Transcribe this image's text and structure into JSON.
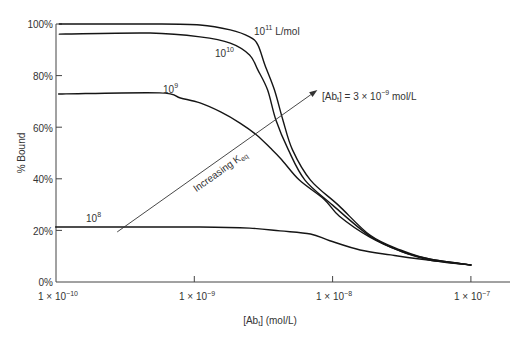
{
  "chart_data": {
    "type": "line",
    "title": "",
    "xlabel": "[Ab_t] (mol/L)",
    "ylabel": "% Bound",
    "xscale": "log",
    "xlim": [
      1e-10,
      1e-07
    ],
    "ylim": [
      0,
      100
    ],
    "grid": false,
    "legend": null,
    "x_ticks": [
      1e-10,
      1e-09,
      1e-08,
      1e-07
    ],
    "x_tick_labels": [
      "1 × 10^-10",
      "1 × 10^-9",
      "1 × 10^-8",
      "1 × 10^-7"
    ],
    "y_ticks": [
      0,
      20,
      40,
      60,
      80,
      100
    ],
    "y_tick_labels": [
      "0%",
      "20%",
      "40%",
      "60%",
      "80%",
      "100%"
    ],
    "series": [
      {
        "name": "10^11 L/mol",
        "keq_L_per_mol": 100000000000.0,
        "x": [
          1.17e-10,
          4.79e-10,
          1.1e-09,
          1.82e-09,
          2.51e-09,
          2.88e-09,
          3.24e-09,
          3.8e-09,
          4.37e-09,
          5.13e-09,
          6.92e-09,
          1.1e-08,
          1.86e-08,
          3.09e-08,
          5.01e-08,
          1e-07
        ],
        "y": [
          100,
          100,
          99.6,
          97.7,
          95.0,
          91.9,
          84.1,
          74.4,
          62.8,
          51.2,
          39.5,
          29.8,
          18.2,
          12.4,
          8.9,
          6.6
        ]
      },
      {
        "name": "10^10",
        "keq_L_per_mol": 10000000000.0,
        "x": [
          1.17e-10,
          4.79e-10,
          1.1e-09,
          1.82e-09,
          2.51e-09,
          2.88e-09,
          3.39e-09,
          3.89e-09,
          4.79e-09,
          6.31e-09,
          1e-08,
          1.86e-08,
          3.09e-08,
          5.01e-08,
          1e-07
        ],
        "y": [
          96.1,
          96.5,
          95.0,
          92.6,
          88.0,
          82.2,
          74.4,
          62.8,
          51.2,
          39.5,
          29.8,
          17.8,
          12.0,
          8.9,
          6.6
        ]
      },
      {
        "name": "10^9",
        "keq_L_per_mol": 1000000000.0,
        "x": [
          1.17e-10,
          5.62e-10,
          7.94e-10,
          1.1e-09,
          1.55e-09,
          2.14e-09,
          2.82e-09,
          3.55e-09,
          4.27e-09,
          5.75e-09,
          8.71e-09,
          1.12e-08,
          1.86e-08,
          3.09e-08,
          5.01e-08,
          1e-07
        ],
        "y": [
          72.9,
          73.3,
          71.3,
          69.4,
          65.9,
          61.6,
          57.0,
          51.9,
          47.5,
          39.5,
          32.0,
          25.5,
          17.4,
          12.0,
          8.5,
          6.6
        ]
      },
      {
        "name": "10^8",
        "keq_L_per_mol": 100000000.0,
        "x": [
          1.17e-10,
          1.1e-09,
          2.51e-09,
          4.17e-09,
          6.92e-09,
          9.55e-09,
          1.58e-08,
          2.63e-08,
          4.27e-08,
          1e-07
        ],
        "y": [
          21.3,
          21.3,
          20.9,
          19.8,
          18.6,
          16.0,
          12.4,
          10.5,
          8.9,
          6.6
        ]
      }
    ],
    "annotations": [
      {
        "type": "text",
        "text": "[Ab_t] = 3 × 10^-9 mol/L"
      },
      {
        "type": "arrow",
        "text": "Increasing K_eq",
        "from": [
          2.77e-10,
          19.4
        ],
        "to": [
          7.76e-09,
          74.4
        ]
      }
    ]
  },
  "display": {
    "x_ticks": [
      {
        "mant": "1 × 10",
        "exp": "−10"
      },
      {
        "mant": "1 × 10",
        "exp": "−9"
      },
      {
        "mant": "1 × 10",
        "exp": "−8"
      },
      {
        "mant": "1 × 10",
        "exp": "−7"
      }
    ],
    "xlabel": {
      "pre": "[Ab",
      "sub": "t",
      "post": "] (mol/L)"
    },
    "series_labels": [
      {
        "base": "10",
        "exp": "11",
        "unit": " L/mol"
      },
      {
        "base": "10",
        "exp": "10"
      },
      {
        "base": "10",
        "exp": "9"
      },
      {
        "base": "10",
        "exp": "8"
      }
    ],
    "annotation": {
      "pre": "[Ab",
      "sub": "t",
      "mid": "] = 3 × 10",
      "exp": "−9",
      "unit": " mol/L"
    },
    "arrow_label": {
      "text": "Increasing K",
      "sub": "eq"
    }
  }
}
